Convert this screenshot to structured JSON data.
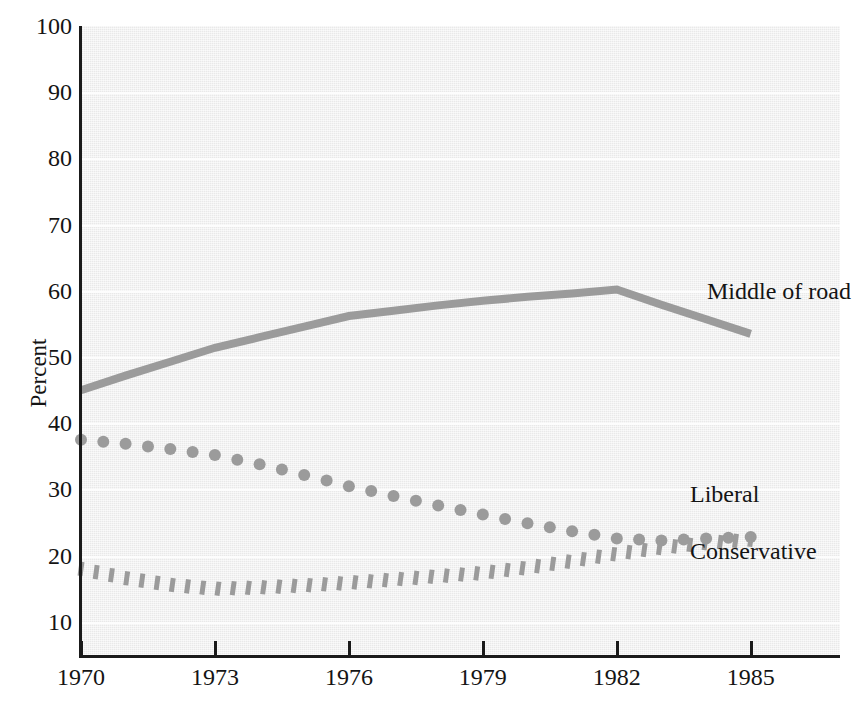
{
  "figure": {
    "title_remnant": "grouping by",
    "background_color": "#e9e9e9",
    "series_color": "#9b9b9b",
    "axis_color": "#1a1a1a"
  },
  "axes": {
    "ylabel": "Percent",
    "xlabel": "",
    "y_ticks": [
      "10",
      "20",
      "30",
      "40",
      "50",
      "60",
      "70",
      "80",
      "90",
      "100"
    ],
    "x_ticks": [
      "1970",
      "1973",
      "1976",
      "1979",
      "1982",
      "1985"
    ]
  },
  "labels": {
    "middle_of_road": "Middle of road",
    "liberal": "Liberal",
    "conservative": "Conservative"
  },
  "chart_data": {
    "type": "line",
    "title": "",
    "xlabel": "",
    "ylabel": "Percent",
    "xlim": [
      1970,
      1987
    ],
    "ylim": [
      5,
      100
    ],
    "grid": true,
    "legend": "inline-right-labels",
    "x": [
      1970,
      1971,
      1972,
      1973,
      1974,
      1975,
      1976,
      1977,
      1978,
      1979,
      1980,
      1981,
      1982,
      1983,
      1984,
      1985
    ],
    "series": [
      {
        "name": "Middle of road",
        "style": "solid-thick",
        "color": "#9b9b9b",
        "values": [
          45.0,
          47.2,
          49.3,
          51.4,
          53.0,
          54.6,
          56.2,
          57.0,
          57.8,
          58.5,
          59.1,
          59.6,
          60.2,
          57.9,
          55.7,
          53.5
        ]
      },
      {
        "name": "Liberal",
        "style": "dotted-round",
        "color": "#9b9b9b",
        "values": [
          37.5,
          36.9,
          36.1,
          35.2,
          33.8,
          32.2,
          30.5,
          29.0,
          27.6,
          26.2,
          24.9,
          23.7,
          22.6,
          22.3,
          22.6,
          22.8
        ]
      },
      {
        "name": "Conservative",
        "style": "dotted-dash",
        "color": "#9b9b9b",
        "values": [
          18.0,
          16.6,
          15.6,
          15.0,
          15.2,
          15.5,
          15.9,
          16.4,
          16.9,
          17.4,
          18.2,
          19.2,
          20.3,
          21.2,
          21.9,
          22.4
        ]
      }
    ]
  }
}
